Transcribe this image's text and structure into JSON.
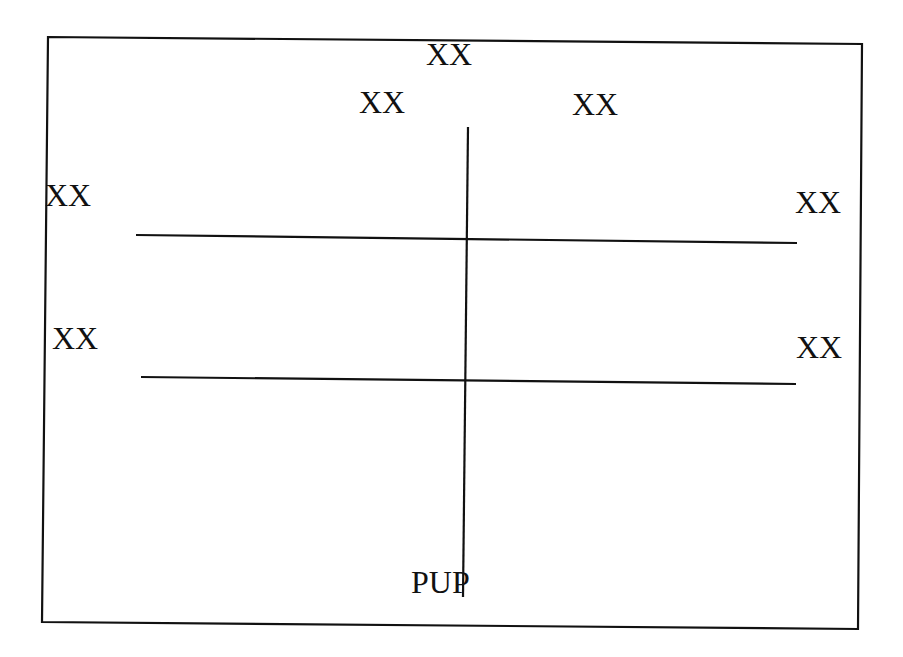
{
  "diagram": {
    "labels": {
      "top_center": "XX",
      "top_left": "XX",
      "top_right": "XX",
      "left_upper": "XX",
      "right_upper": "XX",
      "left_lower": "XX",
      "right_lower": "XX",
      "bottom": "PUP"
    },
    "colors": {
      "stroke": "#111111",
      "background": "#ffffff"
    }
  }
}
